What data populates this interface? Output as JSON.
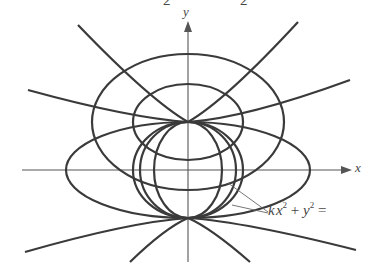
{
  "diagram": {
    "title_fragment_left": "2",
    "title_fragment_right": "2",
    "axes": {
      "x_label": "x",
      "y_label": "y"
    },
    "annotation": {
      "k": "k",
      "x": "x",
      "exp1": "2",
      "plus": "+",
      "y": "y",
      "exp2": "2",
      "eq": "="
    },
    "colors": {
      "stroke": "#3a3a3a",
      "background": "#ffffff"
    }
  }
}
